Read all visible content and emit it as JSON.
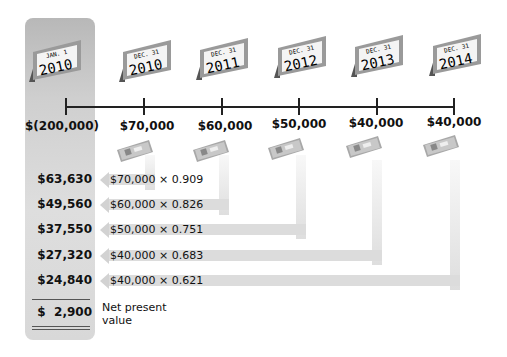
{
  "calendars": [
    {
      "month_day": "JAN. 1",
      "year": "2010",
      "x": 27
    },
    {
      "month_day": "DEC. 31",
      "year": "2010",
      "x": 117
    },
    {
      "month_day": "DEC. 31",
      "year": "2011",
      "x": 194
    },
    {
      "month_day": "DEC. 31",
      "year": "2012",
      "x": 272
    },
    {
      "month_day": "DEC. 31",
      "year": "2013",
      "x": 349
    },
    {
      "month_day": "DEC. 31",
      "year": "2014",
      "x": 427
    }
  ],
  "cash_flows": [
    "$(200,000)",
    "$70,000",
    "$60,000",
    "$50,000",
    "$40,000",
    "$40,000"
  ],
  "present_values": [
    "$63,630",
    "$49,560",
    "$37,550",
    "$27,320",
    "$24,840"
  ],
  "calculations": [
    "$70,000 × 0.909",
    "$60,000 × 0.826",
    "$50,000 × 0.751",
    "$40,000 × 0.683",
    "$40,000 × 0.621"
  ],
  "net_present_value": {
    "amount": "$  2,900",
    "label_line1": "Net present",
    "label_line2": "value"
  },
  "colors": {
    "panel": "#cfcfcf",
    "arrow": "#dcdcdc",
    "text": "#111111"
  }
}
